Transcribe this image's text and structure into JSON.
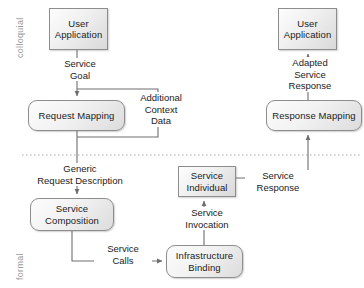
{
  "diagram": {
    "colors": {
      "node_border": "#8d8d8d",
      "node_fill_light": "#fdfdfd",
      "node_fill_dark": "#d9d9d9",
      "connector": "#6e6e6e",
      "divider": "#b4b4b4",
      "side_label": "#9a9a9a",
      "text": "#1b1b1b"
    },
    "bands": [
      {
        "id": "colloquial",
        "label": "colloquial"
      },
      {
        "id": "formal",
        "label": "formal"
      }
    ],
    "divider": {
      "style": "dotted",
      "y": 155
    },
    "nodes": [
      {
        "id": "user-application-left",
        "label": "User\nApplication",
        "shape": "rect",
        "x": 49,
        "y": 8,
        "w": 59,
        "h": 42
      },
      {
        "id": "request-mapping",
        "label": "Request Mapping",
        "shape": "rounded",
        "x": 28,
        "y": 100,
        "w": 97,
        "h": 31
      },
      {
        "id": "service-composition",
        "label": "Service\nComposition",
        "shape": "rounded",
        "x": 30,
        "y": 198,
        "w": 84,
        "h": 33
      },
      {
        "id": "infrastructure-binding",
        "label": "Infrastructure\nBinding",
        "shape": "rounded",
        "x": 166,
        "y": 245,
        "w": 77,
        "h": 33
      },
      {
        "id": "service-individual",
        "label": "Service\nIndividual",
        "shape": "rect",
        "x": 178,
        "y": 166,
        "w": 58,
        "h": 31
      },
      {
        "id": "response-mapping",
        "label": "Response Mapping",
        "shape": "rounded",
        "x": 266,
        "y": 100,
        "w": 96,
        "h": 31
      },
      {
        "id": "user-application-right",
        "label": "User\nApplication",
        "shape": "rect",
        "x": 278,
        "y": 8,
        "w": 59,
        "h": 42
      }
    ],
    "edge_labels": [
      {
        "id": "service-goal",
        "text": "Service\nGoal",
        "x": 50,
        "y": 58,
        "w": 56
      },
      {
        "id": "additional-context-data",
        "text": "Additional\nContext\nData",
        "x": 130,
        "y": 92,
        "w": 58
      },
      {
        "id": "generic-request-description",
        "text": "Generic\nRequest Description",
        "x": 30,
        "y": 163,
        "w": 110
      },
      {
        "id": "service-calls",
        "text": "Service\nCalls",
        "x": 94,
        "y": 243,
        "w": 54
      },
      {
        "id": "service-invocation",
        "text": "Service\nInvocation",
        "x": 176,
        "y": 207,
        "w": 64
      },
      {
        "id": "service-response",
        "text": "Service\nResponse",
        "x": 245,
        "y": 170,
        "w": 62
      },
      {
        "id": "adapted-service-response",
        "text": "Adapted\nService\nResponse",
        "x": 278,
        "y": 57,
        "w": 60
      }
    ],
    "connectors": [
      {
        "id": "user-app-to-request-mapping",
        "from": "user-application-left",
        "to": "request-mapping",
        "arrow": true
      },
      {
        "id": "context-data-loop",
        "from": "user-application-left",
        "to": "request-mapping",
        "arrow": false
      },
      {
        "id": "request-mapping-to-service-composition",
        "from": "request-mapping",
        "to": "service-composition",
        "arrow": true
      },
      {
        "id": "service-composition-to-infrastructure-binding",
        "from": "service-composition",
        "to": "infrastructure-binding",
        "arrow": true
      },
      {
        "id": "infrastructure-binding-to-service-individual",
        "from": "infrastructure-binding",
        "to": "service-individual",
        "arrow": true
      },
      {
        "id": "service-individual-to-response-mapping",
        "from": "service-individual",
        "to": "response-mapping",
        "arrow": true
      },
      {
        "id": "response-mapping-to-user-app",
        "from": "response-mapping",
        "to": "user-application-right",
        "arrow": true
      }
    ]
  }
}
